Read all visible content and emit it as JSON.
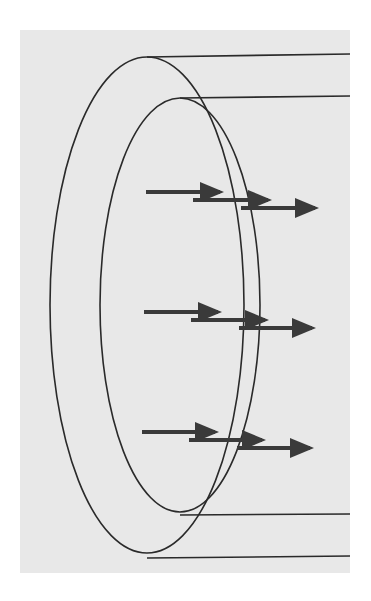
{
  "diagram": {
    "colors": {
      "page_background": "#ffffff",
      "panel_background": "#e8e8e8",
      "outline": "#2a2a2a",
      "arrow": "#3a3a3a"
    },
    "panel": {
      "x": 20,
      "y": 30,
      "width": 330,
      "height": 543
    },
    "ellipses": [
      {
        "name": "outer-cross-section",
        "cx": 147,
        "cy": 305,
        "rx": 97,
        "ry": 248
      },
      {
        "name": "inner-cross-section",
        "cx": 180,
        "cy": 305,
        "rx": 80,
        "ry": 207
      }
    ],
    "lines": [
      {
        "name": "outer-top-edge",
        "x1": 147,
        "y1": 57,
        "x2": 350,
        "y2": 54
      },
      {
        "name": "inner-top-edge",
        "x1": 180,
        "y1": 98,
        "x2": 350,
        "y2": 96
      },
      {
        "name": "inner-bottom-edge",
        "x1": 180,
        "y1": 515,
        "x2": 350,
        "y2": 514
      },
      {
        "name": "outer-bottom-edge",
        "x1": 147,
        "y1": 558,
        "x2": 350,
        "y2": 556
      }
    ],
    "arrow_rows": [
      {
        "name": "top-row",
        "arrows": [
          {
            "x1": 146,
            "x2": 230,
            "y": 192
          },
          {
            "x1": 193,
            "x2": 278,
            "y": 200
          },
          {
            "x1": 241,
            "x2": 325,
            "y": 208
          }
        ]
      },
      {
        "name": "middle-row",
        "arrows": [
          {
            "x1": 144,
            "x2": 228,
            "y": 312
          },
          {
            "x1": 191,
            "x2": 275,
            "y": 320
          },
          {
            "x1": 239,
            "x2": 322,
            "y": 328
          }
        ]
      },
      {
        "name": "bottom-row",
        "arrows": [
          {
            "x1": 142,
            "x2": 225,
            "y": 432
          },
          {
            "x1": 189,
            "x2": 272,
            "y": 440
          },
          {
            "x1": 237,
            "x2": 320,
            "y": 448
          }
        ]
      }
    ]
  }
}
